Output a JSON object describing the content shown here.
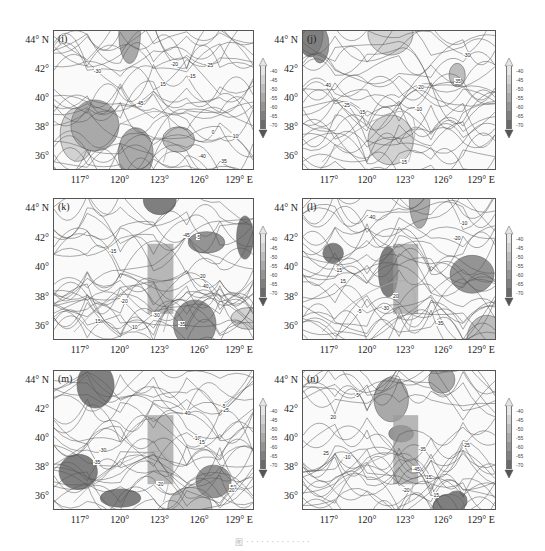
{
  "figure": {
    "caption": "图 · · · · · · · · · · · · ·",
    "colorbar": {
      "labels": [
        "-40",
        "-45",
        "-50",
        "-55",
        "-60",
        "-65",
        "-70"
      ],
      "colors": [
        "#e6e6e6",
        "#d2d2d2",
        "#bdbdbd",
        "#a9a9a9",
        "#949494",
        "#7f7f7f",
        "#6a6a6a"
      ]
    },
    "axes": {
      "lat_labels": [
        "44° N",
        "42°",
        "40°",
        "38°",
        "36°"
      ],
      "lon_labels": [
        "117°",
        "120°",
        "123°",
        "126°",
        "129° E"
      ]
    },
    "panels": [
      {
        "id": "i",
        "label": "(i)",
        "contour_labels": [
          "-45",
          "-35",
          "-30",
          "-25",
          "-15",
          "-10",
          "-40",
          "0",
          "15",
          "-20"
        ]
      },
      {
        "id": "j",
        "label": "(j)",
        "contour_labels": [
          "-40",
          "-35",
          "-30",
          "-25",
          "-15",
          "-10",
          "15",
          "-20"
        ]
      },
      {
        "id": "k",
        "label": "(k)",
        "contour_labels": [
          "-45",
          "-40",
          "-35",
          "-30",
          "-20",
          "-15",
          "-5",
          "10",
          "15",
          "20"
        ]
      },
      {
        "id": "l",
        "label": "(l)",
        "contour_labels": [
          "-40",
          "-35",
          "-30",
          "-20",
          "-15",
          "-10",
          "-5",
          "15",
          "20"
        ]
      },
      {
        "id": "m",
        "label": "(m)",
        "contour_labels": [
          "-50",
          "-40",
          "-35",
          "-30",
          "-25",
          "-20",
          "-10",
          "-5",
          "15",
          "20"
        ]
      },
      {
        "id": "n",
        "label": "(n)",
        "contour_labels": [
          "-45",
          "-35",
          "-25",
          "-20",
          "-15",
          "-10",
          "-5",
          "15",
          "20",
          "25"
        ]
      }
    ]
  }
}
